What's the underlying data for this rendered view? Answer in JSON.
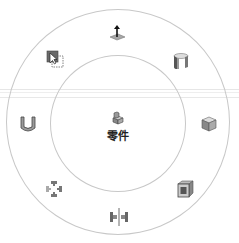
{
  "menu": {
    "center": {
      "label": "零件",
      "icon": "part-icon"
    },
    "items": [
      {
        "name": "extrude-icon",
        "tooltip": ""
      },
      {
        "name": "revolve-icon",
        "tooltip": ""
      },
      {
        "name": "box-view-icon",
        "tooltip": ""
      },
      {
        "name": "shell-icon",
        "tooltip": ""
      },
      {
        "name": "mirror-icon",
        "tooltip": ""
      },
      {
        "name": "pattern-icon",
        "tooltip": ""
      },
      {
        "name": "sheet-metal-icon",
        "tooltip": ""
      },
      {
        "name": "select-icon",
        "tooltip": ""
      }
    ]
  },
  "colors": {
    "ring": "#c8c8c8",
    "icon_dark": "#555555",
    "icon_mid": "#8a8a8a",
    "icon_light": "#c0c0c0"
  }
}
